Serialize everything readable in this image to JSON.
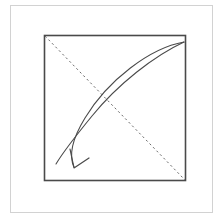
{
  "figure": {
    "title": "Square with diagonal crease and curved fold arrow",
    "canvas": {
      "width": 223,
      "height": 223,
      "background": "#ffffff"
    },
    "outer_frame": {
      "name": "outer-frame",
      "x": 10.5,
      "y": 5.5,
      "width": 202,
      "height": 207,
      "stroke": "#d2d2d2",
      "stroke_width": 1,
      "fill": "none"
    },
    "inner_square": {
      "name": "inner-square",
      "x": 44.5,
      "y": 35.5,
      "width": 141,
      "height": 145,
      "stroke": "#4a4a4a",
      "stroke_width": 1.6,
      "fill": "none"
    },
    "dashed_diagonal": {
      "name": "dashed-diagonal",
      "x1": 45,
      "y1": 36,
      "x2": 185,
      "y2": 180,
      "stroke": "#6b6b6b",
      "stroke_width": 1,
      "dash_pattern": "2.2 2.8"
    },
    "arrow_curve_outer": {
      "name": "arrow-curve-outer",
      "path": "M 184 42 C 150 48, 108 80, 85 118 C 74 136, 68 154, 74 167",
      "stroke": "#4a4a4a",
      "stroke_width": 1.1,
      "fill": "none"
    },
    "arrow_curve_inner": {
      "name": "arrow-curve-inner",
      "path": "M 184 42 C 154 56, 118 84, 92 116 C 74 138, 62 154, 56 164",
      "stroke": "#4a4a4a",
      "stroke_width": 1.1,
      "fill": "none"
    },
    "arrowhead": {
      "name": "arrowhead",
      "path": "M 70 149 L 74 168 L 89 158",
      "tip_x": 74,
      "tip_y": 168,
      "stroke": "#4a4a4a",
      "stroke_width": 1.2,
      "fill": "none",
      "style": "open-v"
    }
  }
}
